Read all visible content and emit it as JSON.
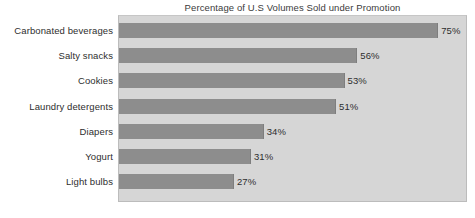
{
  "chart_data": {
    "type": "bar",
    "orientation": "horizontal",
    "title": "Percentage of U.S Volumes Sold under Promotion",
    "xlabel": "",
    "ylabel": "",
    "xlim": [
      0,
      82
    ],
    "grid": false,
    "legend": null,
    "value_suffix": "%",
    "categories": [
      "Carbonated beverages",
      "Salty snacks",
      "Cookies",
      "Laundry detergents",
      "Diapers",
      "Yogurt",
      "Light bulbs"
    ],
    "values": [
      75,
      56,
      53,
      51,
      34,
      31,
      27
    ],
    "value_labels": [
      "75%",
      "56%",
      "53%",
      "51%",
      "34%",
      "31%",
      "27%"
    ],
    "colors": {
      "bar": "#8d8d8d",
      "plot_background": "#d6d6d6",
      "page_background": "#ffffff",
      "text": "#2e2e2e",
      "title_text": "#3b3b3b",
      "plot_border": "#bcbcbc"
    }
  }
}
